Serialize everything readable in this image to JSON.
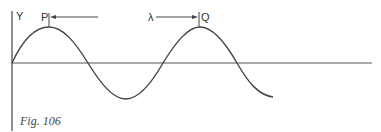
{
  "figure": {
    "caption": "Fig. 106",
    "y_axis_label": "Y",
    "point_p_label": "P",
    "point_q_label": "Q",
    "wavelength_label": "λ",
    "line_color": "#444444"
  }
}
